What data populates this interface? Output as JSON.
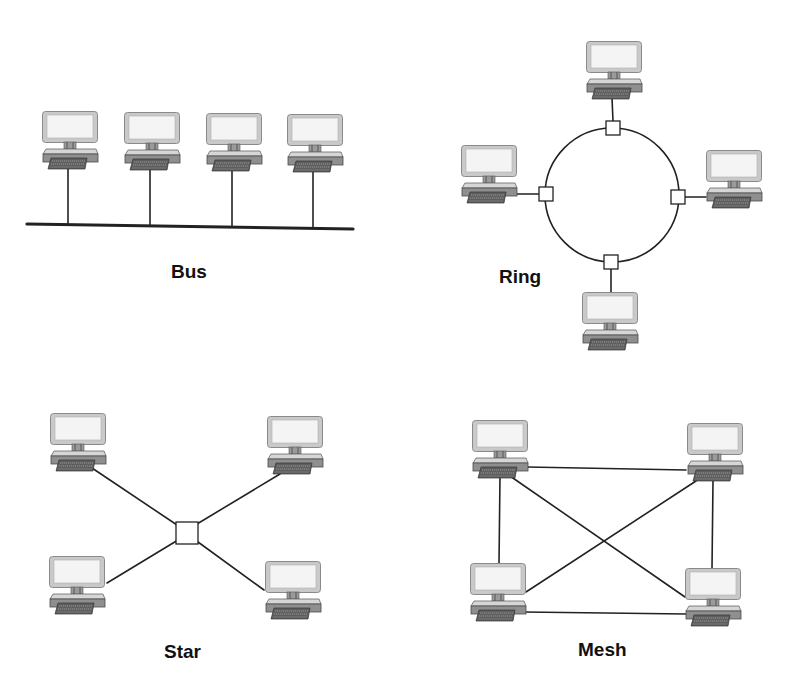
{
  "figure": {
    "width": 794,
    "height": 697,
    "background": "#ffffff",
    "colors": {
      "line": "#222222",
      "monitor_frame": "#c9c9c9",
      "monitor_border": "#8a8a8a",
      "monitor_screen": "#f4f4f4",
      "neck": "#9a9a9a",
      "base_top": "#d6d6d6",
      "base_front": "#8f8f8f",
      "keyboard": "#5e5e5e",
      "keyboard_keys": "#a8a8a8",
      "connector_fill": "#ffffff",
      "label": "#111111"
    }
  },
  "topologies": [
    {
      "id": "bus",
      "label": "Bus",
      "label_pos": [
        171,
        262
      ],
      "computers": [
        [
          42,
          111
        ],
        [
          124,
          112
        ],
        [
          206,
          113
        ],
        [
          287,
          114
        ]
      ],
      "backbone": [
        [
          27,
          224
        ],
        [
          353,
          229
        ]
      ],
      "links": [
        [
          [
            68,
            168
          ],
          [
            68,
            225
          ]
        ],
        [
          [
            150,
            170
          ],
          [
            150,
            226
          ]
        ],
        [
          [
            232,
            171
          ],
          [
            232,
            227
          ]
        ],
        [
          [
            313,
            172
          ],
          [
            313,
            228
          ]
        ]
      ]
    },
    {
      "id": "ring",
      "label": "Ring",
      "label_pos": [
        499,
        267
      ],
      "ring": {
        "cx": 612,
        "cy": 195,
        "r": 67
      },
      "connectors": [
        [
          613,
          128
        ],
        [
          546,
          194
        ],
        [
          678,
          197
        ],
        [
          611,
          262
        ]
      ],
      "computers": [
        [
          586,
          41
        ],
        [
          461,
          145
        ],
        [
          706,
          150
        ],
        [
          582,
          292
        ]
      ],
      "links": [
        [
          [
            612,
            98
          ],
          [
            613,
            121
          ]
        ],
        [
          [
            517,
            194
          ],
          [
            539,
            194
          ]
        ],
        [
          [
            685,
            197
          ],
          [
            706,
            197
          ]
        ],
        [
          [
            611,
            269
          ],
          [
            611,
            292
          ]
        ]
      ]
    },
    {
      "id": "star",
      "label": "Star",
      "label_pos": [
        164,
        642
      ],
      "hub": [
        187,
        533
      ],
      "computers": [
        [
          50,
          413
        ],
        [
          267,
          416
        ],
        [
          49,
          556
        ],
        [
          265,
          561
        ]
      ],
      "links": [
        [
          [
            92,
            468
          ],
          [
            180,
            527
          ]
        ],
        [
          [
            280,
            474
          ],
          [
            197,
            524
          ]
        ],
        [
          [
            107,
            583
          ],
          [
            178,
            540
          ]
        ],
        [
          [
            264,
            590
          ],
          [
            198,
            542
          ]
        ]
      ]
    },
    {
      "id": "mesh",
      "label": "Mesh",
      "label_pos": [
        578,
        640
      ],
      "computers": [
        [
          472,
          420
        ],
        [
          687,
          423
        ],
        [
          470,
          563
        ],
        [
          685,
          568
        ]
      ],
      "links": [
        [
          [
            527,
            467
          ],
          [
            686,
            470
          ]
        ],
        [
          [
            500,
            476
          ],
          [
            499,
            564
          ]
        ],
        [
          [
            713,
            481
          ],
          [
            712,
            569
          ]
        ],
        [
          [
            524,
            612
          ],
          [
            686,
            614
          ]
        ],
        [
          [
            510,
            476
          ],
          [
            685,
            597
          ]
        ],
        [
          [
            696,
            481
          ],
          [
            526,
            592
          ]
        ]
      ]
    }
  ]
}
